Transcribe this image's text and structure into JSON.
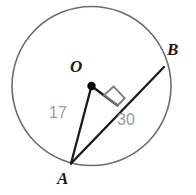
{
  "figure": {
    "kind": "circle-geometry-diagram"
  },
  "labels": {
    "center": "O",
    "point_a": "A",
    "point_b": "B",
    "radius_measure": "17",
    "chord_measure": "30"
  },
  "colors": {
    "circle_stroke": "#6b6b6b",
    "segment_stroke": "#1a1a1a",
    "vertex_label": "#1a1a1a",
    "measure_label": "#9a9a9a",
    "center_dot": "#000000",
    "background": "#ffffff"
  },
  "geometry": {
    "circle": {
      "cx": 91.5,
      "cy": 86,
      "r": 79.5,
      "stroke_width": 1.6
    },
    "center_dot": {
      "cx": 91.5,
      "cy": 86,
      "r": 4.2
    },
    "points": {
      "O": {
        "x": 91.5,
        "y": 86
      },
      "A": {
        "x": 71,
        "y": 163.5
      },
      "B": {
        "x": 164,
        "y": 67
      },
      "foot": {
        "x": 117.5,
        "y": 105.5
      }
    },
    "segments": [
      {
        "name": "chord-AB",
        "from": "A",
        "to": "B",
        "stroke_width": 2.3
      },
      {
        "name": "radius-OA",
        "from": "O",
        "to": "A",
        "stroke_width": 2.3
      },
      {
        "name": "perpendicular-O-to-chord",
        "from": "O",
        "to": "foot",
        "stroke_width": 2.3
      }
    ],
    "right_angle_marker": {
      "name": "right-angle-square",
      "points": "104.2,95.0 113.6,86.6 124.8,98.2 117.5,105.5",
      "stroke_width": 1.8,
      "stroke": "#7a7a7a"
    }
  }
}
